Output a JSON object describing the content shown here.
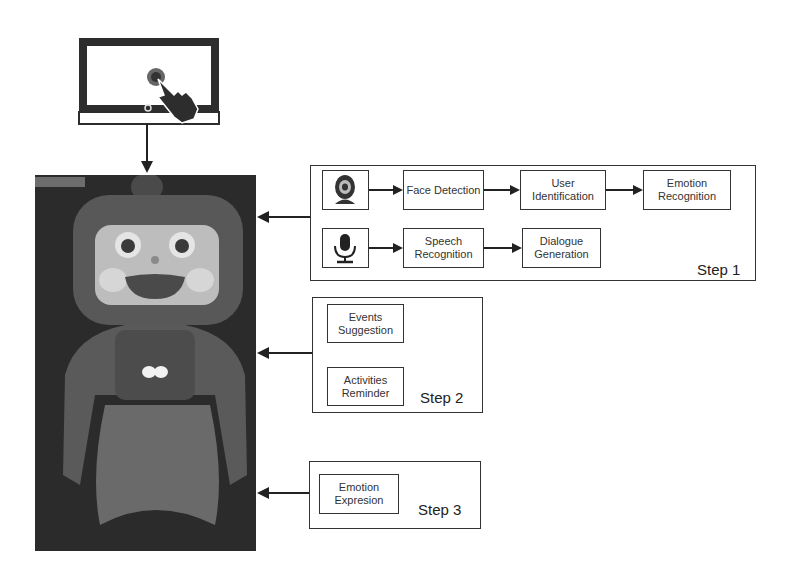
{
  "diagram": {
    "input_device": {
      "icon": "tablet-touch-icon"
    },
    "robot_photo": {
      "subject": "companion-robot"
    },
    "step1": {
      "label": "Step 1",
      "row1": {
        "icon": "webcam-icon",
        "nodes": [
          "Face Detection",
          "User Identification",
          "Emotion Recognition"
        ]
      },
      "row2": {
        "icon": "microphone-icon",
        "nodes": [
          "Speech Recognition",
          "Dialogue Generation"
        ]
      }
    },
    "step2": {
      "label": "Step 2",
      "nodes": [
        "Events Suggestion",
        "Activities Reminder"
      ]
    },
    "step3": {
      "label": "Step 3",
      "nodes": [
        "Emotion Expresion"
      ]
    },
    "colors": {
      "stroke": "#222222",
      "background": "#ffffff",
      "photo_bg": "#2b2b2b"
    }
  }
}
